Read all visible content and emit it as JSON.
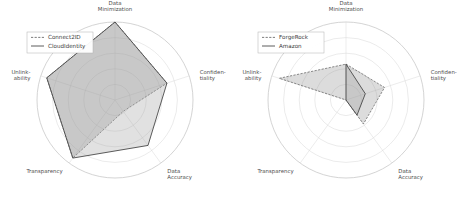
{
  "chart_data": [
    {
      "type": "radar",
      "title": "",
      "panel": "left",
      "categories": [
        "Data Minimization",
        "Confidentiality",
        "Data Accuracy",
        "Transparency",
        "Unlinkability"
      ],
      "category_lines": [
        [
          "Data",
          "Minimization"
        ],
        [
          "Confiden-",
          "tiality"
        ],
        [
          "Data",
          "Accuracy"
        ],
        [
          "Transparency"
        ],
        [
          "Unlink-",
          "ability"
        ]
      ],
      "rlim": [
        0,
        5
      ],
      "grid_rings": [
        1,
        2,
        3,
        4,
        5
      ],
      "grid": true,
      "legend_position": "upper-left",
      "series": [
        {
          "name": "Connect2ID",
          "values": [
            5,
            3.5,
            0.9,
            4.6,
            4.6
          ],
          "style": "dashed"
        },
        {
          "name": "CloudIdentity",
          "values": [
            5,
            3.5,
            3.6,
            4.6,
            4.6
          ],
          "style": "solid"
        }
      ]
    },
    {
      "type": "radar",
      "title": "",
      "panel": "right",
      "categories": [
        "Data Minimization",
        "Confidentiality",
        "Data Accuracy",
        "Transparency",
        "Unlinkability"
      ],
      "category_lines": [
        [
          "Data",
          "Minimization"
        ],
        [
          "Confiden-",
          "tiality"
        ],
        [
          "Data",
          "Accuracy"
        ],
        [
          "Transparency"
        ],
        [
          "Unlink-",
          "ability"
        ]
      ],
      "rlim": [
        0,
        5
      ],
      "grid_rings": [
        1,
        2,
        3,
        4,
        5
      ],
      "grid": true,
      "legend_position": "upper-left",
      "series": [
        {
          "name": "ForgeRock",
          "values": [
            2.3,
            2.6,
            1.9,
            0,
            4.5
          ],
          "style": "dashed"
        },
        {
          "name": "Amazon",
          "values": [
            2.3,
            1.3,
            1.2,
            0,
            0
          ],
          "style": "solid"
        }
      ]
    }
  ],
  "colors": {
    "series_a_line": "#6e6e6e",
    "series_b_line": "#4a4a4a",
    "fill": "#8c8c8c",
    "grid": "#d6d6d6",
    "outer_ring": "#c2c2c2",
    "label_text": "#4d4d4d",
    "background": "#ffffff"
  }
}
